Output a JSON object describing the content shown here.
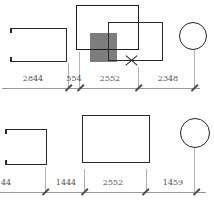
{
  "drawing": {
    "type": "cad-floorplan-fragment",
    "top_dimensions": {
      "labels": [
        "2844",
        "554",
        "2552",
        "2348"
      ]
    },
    "bottom_dimensions": {
      "labels": [
        "44",
        "1444",
        "2552",
        "1459"
      ]
    },
    "colors": {
      "shape_stroke": "#222222",
      "gray_fill": "#7d7d7d",
      "dimension_line": "#999999",
      "dimension_text": "#555555",
      "background": "#ffffff"
    }
  }
}
